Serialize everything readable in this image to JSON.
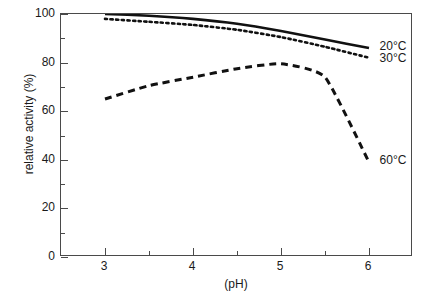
{
  "chart_data": {
    "type": "line",
    "title": "",
    "xlabel": "(pH)",
    "ylabel": "relative activity (%)",
    "xlim": [
      2.5,
      6.5
    ],
    "ylim": [
      0,
      100
    ],
    "grid": false,
    "legend_position": "inline-right-of-curves",
    "x_ticks": [
      {
        "value": 3,
        "label": "3"
      },
      {
        "value": 4,
        "label": "4"
      },
      {
        "value": 5,
        "label": "5"
      },
      {
        "value": 6,
        "label": "6"
      }
    ],
    "x_minor_ticks": [
      3.5,
      4.5,
      5.5
    ],
    "y_ticks": [
      {
        "value": 0,
        "label": "0"
      },
      {
        "value": 20,
        "label": "20"
      },
      {
        "value": 40,
        "label": "40"
      },
      {
        "value": 60,
        "label": "60"
      },
      {
        "value": 80,
        "label": "80"
      },
      {
        "value": 100,
        "label": "100"
      }
    ],
    "y_minor_ticks": [
      10,
      30,
      50,
      70,
      90
    ],
    "x": [
      3.0,
      3.5,
      4.0,
      4.5,
      5.0,
      5.5,
      6.0
    ],
    "series": [
      {
        "name": "20°C",
        "label": "20°C",
        "style": "solid",
        "color": "#111111",
        "values": [
          100.0,
          99.3,
          98.0,
          96.0,
          93.0,
          89.5,
          86.0
        ]
      },
      {
        "name": "30°C",
        "label": "30°C",
        "style": "dotted",
        "color": "#111111",
        "values": [
          98.0,
          96.8,
          95.5,
          93.5,
          90.5,
          86.5,
          82.0
        ]
      },
      {
        "name": "60°C",
        "label": "60°C",
        "style": "dashed",
        "color": "#111111",
        "values": [
          65.0,
          70.5,
          74.0,
          77.5,
          79.5,
          74.0,
          39.0
        ]
      }
    ],
    "annotations": [
      {
        "text": "20°C",
        "x": 6.12,
        "y": 87.0
      },
      {
        "text": "30°C",
        "x": 6.12,
        "y": 82.0
      },
      {
        "text": "60°C",
        "x": 6.12,
        "y": 40.0
      }
    ]
  }
}
